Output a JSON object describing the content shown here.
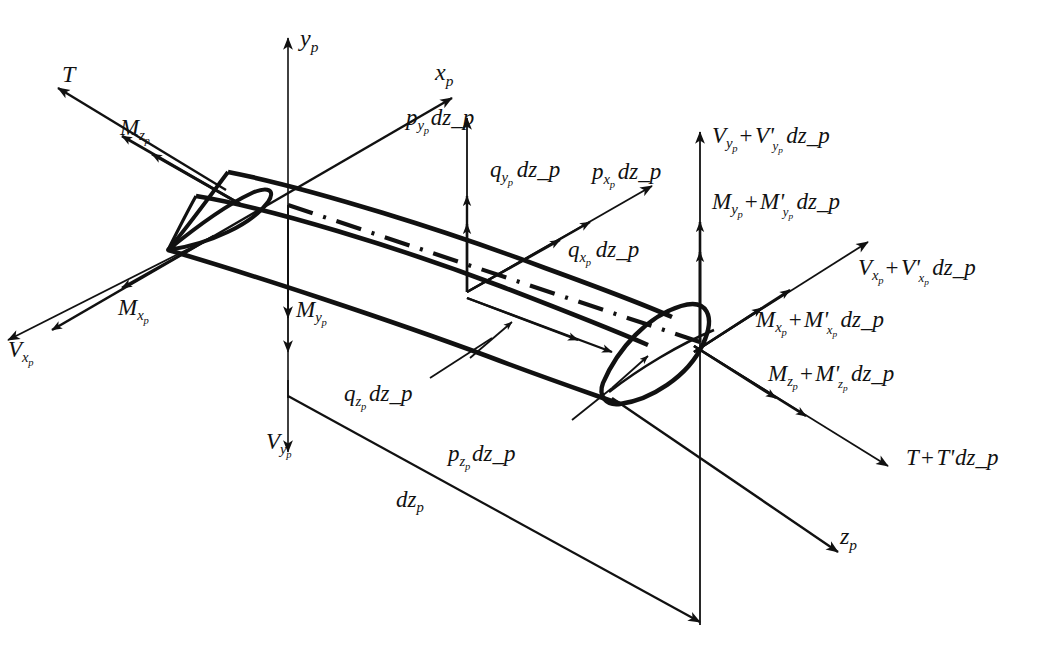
{
  "figure": {
    "background_color": "#ffffff",
    "ink_color": "#111111"
  },
  "axes": [
    {
      "name": "axis-y",
      "label_base": "y",
      "label_sub": "p",
      "text": "y_p"
    },
    {
      "name": "axis-x",
      "label_base": "x",
      "label_sub": "p",
      "text": "x_p"
    },
    {
      "name": "axis-z",
      "label_base": "z",
      "label_sub": "p",
      "text": "z_p"
    }
  ],
  "labels": {
    "y_axis": {
      "base": "y",
      "sub": "p",
      "text": "y_p"
    },
    "x_axis": {
      "base": "x",
      "sub": "p",
      "text": "x_p"
    },
    "z_axis": {
      "base": "z",
      "sub": "p",
      "text": "z_p"
    },
    "T_left": {
      "base": "T",
      "sub": "",
      "text": "T"
    },
    "Mz_left": {
      "base": "M",
      "sub": "z_p",
      "text": "M_z_p"
    },
    "Mx_left": {
      "base": "M",
      "sub": "x_p",
      "text": "M_x_p"
    },
    "Vx_left": {
      "base": "V",
      "sub": "x_p",
      "text": "V_x_p"
    },
    "My_left": {
      "base": "M",
      "sub": "y_p",
      "text": "M_y_p"
    },
    "Vy_left": {
      "base": "V",
      "sub": "y_p",
      "text": "V_y_p"
    },
    "py_dz": {
      "base": "p",
      "sub": "y_p",
      "tail": "dz_p",
      "text": "p_y_p dz_p"
    },
    "qy_dz": {
      "base": "q",
      "sub": "y_p",
      "tail": "dz_p",
      "text": "q_y_p dz_p"
    },
    "px_dz": {
      "base": "p",
      "sub": "x_p",
      "tail": "dz_p",
      "text": "p_x_p dz_p"
    },
    "qx_dz": {
      "base": "q",
      "sub": "x_p",
      "tail": "dz_p",
      "text": "q_x_p dz_p"
    },
    "qz_dz": {
      "base": "q",
      "sub": "z_p",
      "tail": "dz_p",
      "text": "q_z_p dz_p"
    },
    "pz_dz": {
      "base": "p",
      "sub": "z_p",
      "tail": "dz_p",
      "text": "p_z_p dz_p"
    },
    "dz": {
      "base": "dz",
      "sub": "p",
      "text": "dz_p"
    },
    "Vy_right": {
      "text": "V_y_p + V'_y_p dz_p"
    },
    "My_right": {
      "text": "M_y_p + M'_y_p dz_p"
    },
    "Vx_right": {
      "text": "V_x_p + V'_x_p dz_p"
    },
    "Mx_right": {
      "text": "M_x_p + M'_x_p dz_p"
    },
    "Mz_right": {
      "text": "M_z_p + M'_z_p dz_p"
    },
    "T_right": {
      "text": "T + T'dz_p"
    }
  },
  "left_face": {
    "tension": {
      "symbol": "T",
      "sub": ""
    },
    "moment_z": {
      "symbol": "M",
      "sub": "z_p"
    },
    "moment_x": {
      "symbol": "M",
      "sub": "x_p"
    },
    "shear_x": {
      "symbol": "V",
      "sub": "x_p"
    },
    "moment_y": {
      "symbol": "M",
      "sub": "y_p"
    },
    "shear_y": {
      "symbol": "V",
      "sub": "y_p"
    }
  },
  "right_face": {
    "shear_y": {
      "symbol": "V",
      "sub": "y_p",
      "prime": "V'",
      "prime_sub": "y_p",
      "dz": "dz_p"
    },
    "moment_y": {
      "symbol": "M",
      "sub": "y_p",
      "prime": "M'",
      "prime_sub": "y_p",
      "dz": "dz_p"
    },
    "shear_x": {
      "symbol": "V",
      "sub": "x_p",
      "prime": "V'",
      "prime_sub": "x_p",
      "dz": "dz_p"
    },
    "moment_x": {
      "symbol": "M",
      "sub": "x_p",
      "prime": "M'",
      "prime_sub": "x_p",
      "dz": "dz_p"
    },
    "moment_z": {
      "symbol": "M",
      "sub": "z_p",
      "prime": "M'",
      "prime_sub": "z_p",
      "dz": "dz_p"
    },
    "tension": {
      "symbol": "T",
      "sub": "",
      "prime": "T'",
      "prime_sub": "",
      "dz": "dz_p"
    }
  },
  "distributed_loads": {
    "force_y": {
      "symbol": "p",
      "sub": "y_p",
      "dz": "dz_p"
    },
    "moment_y": {
      "symbol": "q",
      "sub": "y_p",
      "dz": "dz_p"
    },
    "force_x": {
      "symbol": "p",
      "sub": "x_p",
      "dz": "dz_p"
    },
    "moment_x": {
      "symbol": "q",
      "sub": "x_p",
      "dz": "dz_p"
    },
    "moment_z": {
      "symbol": "q",
      "sub": "z_p",
      "dz": "dz_p"
    },
    "force_z": {
      "symbol": "p",
      "sub": "z_p",
      "dz": "dz_p"
    }
  },
  "dimension": {
    "length": {
      "symbol": "dz",
      "sub": "p",
      "text": "dz_p"
    }
  }
}
